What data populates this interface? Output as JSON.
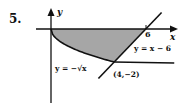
{
  "problem_number": "5.",
  "axes": {
    "x_label": "x",
    "y_label": "y",
    "x_tick_label": "6"
  },
  "curves": [
    {
      "id": "sqrt",
      "equation_label": "y = −√x"
    },
    {
      "id": "line",
      "equation_label": "y = x − 6"
    }
  ],
  "intersection": {
    "label": "(4,−2)",
    "x": 4,
    "y": -2
  },
  "region": {
    "description": "shaded region bounded by x-axis, y = -sqrt(x), and y = x - 6",
    "fill": "#a6a6a6"
  },
  "colors": {
    "ink": "#111111",
    "shade": "#a6a6a6"
  },
  "math": {
    "x_axis_intercept": 6,
    "x_min": -1,
    "x_max": 7.8
  }
}
